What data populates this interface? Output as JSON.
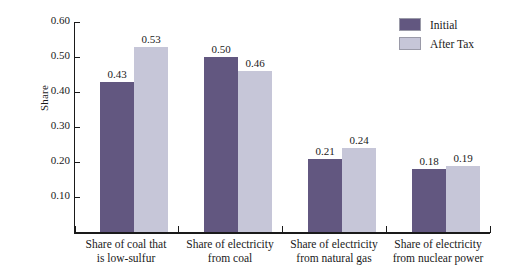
{
  "chart_data": {
    "type": "bar",
    "title": "",
    "xlabel": "",
    "ylabel": "Share",
    "ylim": [
      0.0,
      0.6
    ],
    "yticks": [
      "0.10",
      "0.20",
      "0.30",
      "0.40",
      "0.50",
      "0.60"
    ],
    "ytick_values": [
      0.1,
      0.2,
      0.3,
      0.4,
      0.5,
      0.6
    ],
    "grid": false,
    "legend_position": "top-right",
    "categories": [
      {
        "line1": "Share of coal that",
        "line2": "is low-sulfur"
      },
      {
        "line1": "Share of electricity",
        "line2": "from coal"
      },
      {
        "line1": "Share of electricity",
        "line2": "from natural gas"
      },
      {
        "line1": "Share of electricity",
        "line2": "from nuclear power"
      }
    ],
    "series": [
      {
        "name": "Initial",
        "color": "#625780",
        "values": [
          0.43,
          0.5,
          0.21,
          0.18
        ],
        "labels": [
          "0.43",
          "0.50",
          "0.21",
          "0.18"
        ]
      },
      {
        "name": "After Tax",
        "color": "#c6c6d8",
        "values": [
          0.53,
          0.46,
          0.24,
          0.19
        ],
        "labels": [
          "0.53",
          "0.46",
          "0.24",
          "0.19"
        ]
      }
    ]
  },
  "legend": {
    "items": [
      {
        "label": "Initial",
        "color": "#625780"
      },
      {
        "label": "After Tax",
        "color": "#c6c6d8"
      }
    ]
  }
}
